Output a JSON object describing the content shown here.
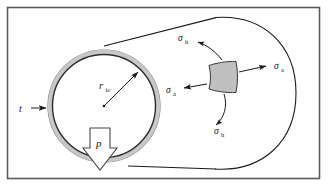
{
  "figure": {
    "frame_color": "#5a5a5a",
    "background_color": "#ffffff",
    "line_color": "#1a1a1a",
    "wall_fill_color": "#c8c8c8",
    "element_fill_color": "#c0c0c0",
    "arrow_fill_color": "#ffffff"
  },
  "labels": {
    "thickness": {
      "symbol": "t",
      "sub": "",
      "name": "wall-thickness"
    },
    "radius": {
      "symbol": "r",
      "sub": "ic",
      "name": "internal-radius"
    },
    "pressure": {
      "symbol": "p",
      "sub": "",
      "name": "internal-pressure"
    },
    "hoop_top": {
      "symbol": "σ",
      "sub": "h",
      "name": "hoop-stress-top"
    },
    "hoop_bottom": {
      "symbol": "σ",
      "sub": "h",
      "name": "hoop-stress-bottom"
    },
    "axial_left": {
      "symbol": "σ",
      "sub": "a",
      "name": "axial-stress-left"
    },
    "axial_right": {
      "symbol": "σ",
      "sub": "a",
      "name": "axial-stress-right"
    }
  }
}
